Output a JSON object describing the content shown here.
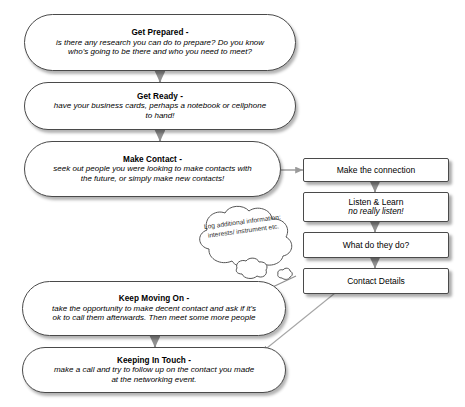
{
  "diagram": {
    "type": "flowchart",
    "title_fragment": "",
    "bottom_caption_fragment": "",
    "colors": {
      "node_fill": "#ffffff",
      "node_border": "#4a4a4a",
      "text": "#000000",
      "connector": "#8a8a8a",
      "shadow": "rgba(0,0,0,0.30)"
    },
    "main_flow": [
      {
        "id": "get-prepared",
        "shape": "stadium",
        "title": "Get Prepared -",
        "body": "is there any research you can do to prepare? Do you know who's going to be there and who you need to meet?"
      },
      {
        "id": "get-ready",
        "shape": "stadium",
        "title": "Get Ready -",
        "body": "have your business cards, perhaps a notebook or cellphone to hand!"
      },
      {
        "id": "make-contact",
        "shape": "stadium",
        "title": "Make Contact -",
        "body": "seek out people you were looking to make contacts with the future, or simply make new contacts!"
      },
      {
        "id": "keep-moving-on",
        "shape": "stadium",
        "title": "Keep Moving On -",
        "body": "take the opportunity to make decent contact and ask if it's ok to call them afterwards. Then meet some more people"
      },
      {
        "id": "keeping-in-touch",
        "shape": "stadium",
        "title": "Keeping In Touch -",
        "body": "make a call and try to follow up on the contact you made at the networking event."
      }
    ],
    "sub_flow": [
      {
        "id": "make-the-connection",
        "shape": "rectangle",
        "line1": "Make the connection",
        "line2": ""
      },
      {
        "id": "listen-and-learn",
        "shape": "rectangle",
        "line1": "Listen & Learn",
        "line2": "no really listen!"
      },
      {
        "id": "what-do-they-do",
        "shape": "rectangle",
        "line1": "What do they do?",
        "line2": ""
      },
      {
        "id": "contact-details",
        "shape": "rectangle",
        "line1": "Contact Details",
        "line2": ""
      }
    ],
    "callout": {
      "id": "log-additional-information",
      "shape": "cloud",
      "text": "Log additional information: interests/ instrument etc."
    },
    "connectors": [
      {
        "from": "get-prepared",
        "to": "get-ready",
        "style": "arrow-down"
      },
      {
        "from": "get-ready",
        "to": "make-contact",
        "style": "arrow-down"
      },
      {
        "from": "make-contact",
        "to": "make-the-connection",
        "style": "arrow-right"
      },
      {
        "from": "make-the-connection",
        "to": "listen-and-learn",
        "style": "arrow-down"
      },
      {
        "from": "listen-and-learn",
        "to": "what-do-they-do",
        "style": "arrow-down"
      },
      {
        "from": "what-do-they-do",
        "to": "contact-details",
        "style": "arrow-down"
      },
      {
        "from": "contact-details",
        "to": "keep-moving-on",
        "style": "arrow-diagonal"
      },
      {
        "from": "contact-details",
        "to": "keeping-in-touch",
        "style": "arrow-diagonal"
      },
      {
        "from": "keep-moving-on",
        "to": "keeping-in-touch",
        "style": "arrow-down"
      }
    ]
  }
}
